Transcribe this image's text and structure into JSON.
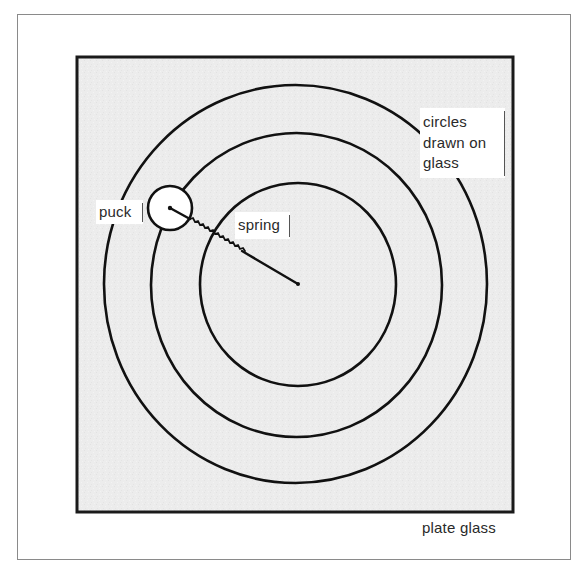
{
  "figure": {
    "caption": "plate glass",
    "background_color": "#ececec",
    "line_color": "#111111",
    "labels": {
      "puck": "puck",
      "spring": "spring",
      "circles_lines": [
        "circles",
        "drawn on",
        "glass"
      ]
    }
  },
  "geometry": {
    "glass_plate": {
      "x": 77,
      "y": 57,
      "width": 436,
      "height": 455
    },
    "center": {
      "x": 298,
      "y": 284
    },
    "circles": [
      {
        "name": "inner",
        "cx": 298,
        "cy": 284.5,
        "rx": 98,
        "ry": 101.5
      },
      {
        "name": "middle",
        "cx": 296.5,
        "cy": 285,
        "rx": 145.5,
        "ry": 152
      },
      {
        "name": "outer",
        "cx": 295.5,
        "cy": 284,
        "rx": 191.5,
        "ry": 199
      }
    ],
    "puck": {
      "cx": 170,
      "cy": 208,
      "r": 22
    },
    "spring": {
      "from": [
        169,
        208
      ],
      "to": [
        298,
        284
      ]
    }
  }
}
